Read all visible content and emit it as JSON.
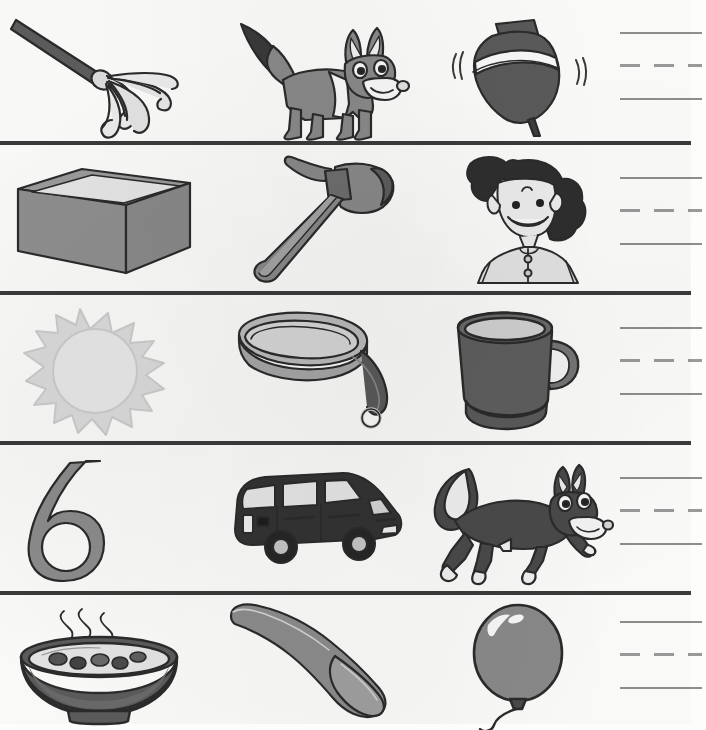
{
  "worksheet": {
    "type": "phonics-picture-worksheet",
    "title": "",
    "columns": 4,
    "rows": 5,
    "writing_lines_per_row": 3,
    "writing_line_style": "solid-dashed-solid",
    "colors": {
      "divider": "#3b3b3b",
      "outline": "#2b2b2b",
      "mid_gray": "#8a8a8a",
      "dark_gray": "#5a5a5a",
      "light_gray": "#d8d8d8",
      "very_light_gray": "#e9e9e9",
      "paper": "#fdfdfc",
      "line_gray": "#8e8e8e"
    }
  },
  "rows": [
    {
      "index": 1,
      "pictures": [
        {
          "name": "mop",
          "label": "mop",
          "icon": "mop-icon"
        },
        {
          "name": "fox",
          "label": "fox",
          "icon": "fox-standing-icon"
        },
        {
          "name": "top",
          "label": "top",
          "icon": "spinning-top-icon"
        }
      ],
      "answer_lines": 3
    },
    {
      "index": 2,
      "pictures": [
        {
          "name": "box",
          "label": "box",
          "icon": "box-icon"
        },
        {
          "name": "ax",
          "label": "ax",
          "icon": "ax-icon"
        },
        {
          "name": "mom",
          "label": "mom",
          "icon": "mom-icon"
        }
      ],
      "answer_lines": 3
    },
    {
      "index": 3,
      "pictures": [
        {
          "name": "sun",
          "label": "sun",
          "icon": "sun-icon"
        },
        {
          "name": "pan",
          "label": "pan",
          "icon": "pan-icon"
        },
        {
          "name": "mug",
          "label": "mug",
          "icon": "mug-icon"
        }
      ],
      "answer_lines": 3
    },
    {
      "index": 4,
      "pictures": [
        {
          "name": "six",
          "label": "six",
          "icon": "numeral-six-icon",
          "numeral": "6"
        },
        {
          "name": "van",
          "label": "van",
          "icon": "van-icon"
        },
        {
          "name": "fox-running",
          "label": "fox",
          "icon": "fox-running-icon"
        }
      ],
      "answer_lines": 3
    },
    {
      "index": 5,
      "pictures": [
        {
          "name": "soup",
          "label": "soup",
          "icon": "soup-bowl-icon"
        },
        {
          "name": "spoon",
          "label": "spoon",
          "icon": "spoon-icon"
        },
        {
          "name": "balloon",
          "label": "balloon",
          "icon": "balloon-icon"
        }
      ],
      "answer_lines": 3
    }
  ]
}
